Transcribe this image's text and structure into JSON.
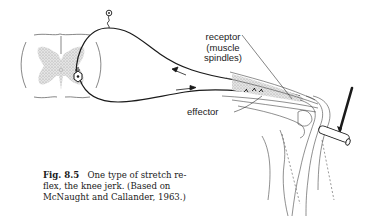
{
  "figure": {
    "labels": {
      "receptor_line1": "receptor",
      "receptor_line2": "(muscle",
      "receptor_line3": "spindles)",
      "effector": "effector"
    },
    "caption": {
      "number": "Fig. 8.5",
      "line1": "One type of stretch re-",
      "line2": "flex, the knee jerk. (Based on",
      "line3": "McNaught and Callander, 1963.)"
    },
    "parts": [
      "spinal-cord-cross-section",
      "sensory-neuron",
      "motor-neuron",
      "quadriceps-muscle",
      "knee-joint",
      "patellar-tendon",
      "reflex-hammer"
    ],
    "colors": {
      "ink": "#1a1a1a",
      "grey_matter": "#c8c8c8",
      "background": "#ffffff"
    }
  }
}
